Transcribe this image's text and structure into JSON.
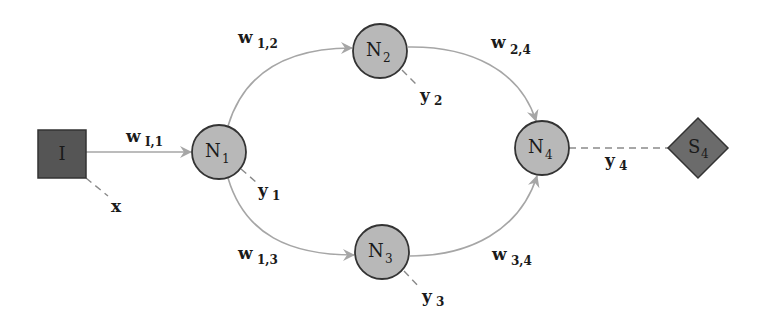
{
  "diagram": {
    "type": "neural-network-graph",
    "colors": {
      "input_fill": "#555555",
      "neuron_fill": "#b8b8b8",
      "output_fill": "#6b6b6b",
      "node_stroke": "#333333",
      "edge": "#a6a6a6",
      "dashed": "#8a8a8a",
      "background": "#ffffff"
    },
    "nodes": [
      {
        "id": "I",
        "shape": "square",
        "label": "I",
        "sub": ""
      },
      {
        "id": "N1",
        "shape": "circle",
        "label": "N",
        "sub": "1"
      },
      {
        "id": "N2",
        "shape": "circle",
        "label": "N",
        "sub": "2"
      },
      {
        "id": "N3",
        "shape": "circle",
        "label": "N",
        "sub": "3"
      },
      {
        "id": "N4",
        "shape": "circle",
        "label": "N",
        "sub": "4"
      },
      {
        "id": "S4",
        "shape": "diamond",
        "label": "S",
        "sub": "4"
      }
    ],
    "edges": [
      {
        "from": "I",
        "to": "N1",
        "label": "w",
        "sub": "I,1"
      },
      {
        "from": "N1",
        "to": "N2",
        "label": "w",
        "sub": "1,2"
      },
      {
        "from": "N1",
        "to": "N3",
        "label": "w",
        "sub": "1,3"
      },
      {
        "from": "N2",
        "to": "N4",
        "label": "w",
        "sub": "2,4"
      },
      {
        "from": "N3",
        "to": "N4",
        "label": "w",
        "sub": "3,4"
      }
    ],
    "outputs": [
      {
        "from": "I",
        "label": "x",
        "sub": ""
      },
      {
        "from": "N1",
        "label": "y",
        "sub": "1"
      },
      {
        "from": "N2",
        "label": "y",
        "sub": "2"
      },
      {
        "from": "N3",
        "label": "y",
        "sub": "3"
      },
      {
        "from": "N4",
        "to": "S4",
        "label": "y",
        "sub": "4"
      }
    ]
  }
}
